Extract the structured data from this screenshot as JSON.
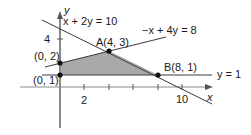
{
  "diagram": {
    "axes": {
      "x_label": "x",
      "y_label": "y",
      "x_ticks": [
        2,
        4,
        6,
        8,
        10
      ],
      "x_tick_labels": [
        "2",
        "10"
      ],
      "y_ticks": [
        2,
        4
      ],
      "y_tick_labels": [
        "4"
      ]
    },
    "lines": [
      {
        "label": "x + 2y = 10",
        "eq": "x + 2y = 10"
      },
      {
        "label": "−x + 4y = 8",
        "eq": "-x + 4y = 8"
      },
      {
        "label": "y = 1",
        "eq": "y = 1"
      }
    ],
    "points": [
      {
        "name": "P1",
        "label": "(0, 2)",
        "x": 0,
        "y": 2
      },
      {
        "name": "P2",
        "label": "(0, 1)",
        "x": 0,
        "y": 1
      },
      {
        "name": "A",
        "label": "A(4, 3)",
        "x": 4,
        "y": 3
      },
      {
        "name": "B",
        "label": "B(8, 1)",
        "x": 8,
        "y": 1
      }
    ],
    "region": {
      "vertices": [
        [
          0,
          1
        ],
        [
          0,
          2
        ],
        [
          4,
          3
        ],
        [
          8,
          1
        ]
      ],
      "fill": "#a9a9a9"
    },
    "colors": {
      "axis": "#8a8a8a",
      "line": "#3a3a3a",
      "point": "#111111"
    }
  }
}
